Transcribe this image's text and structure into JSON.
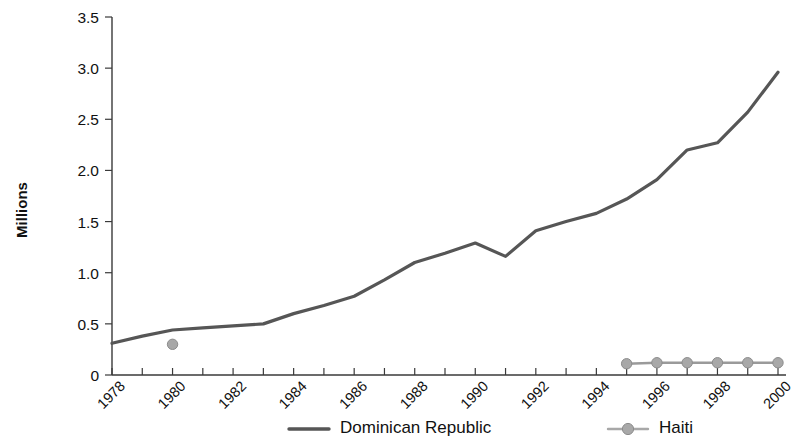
{
  "chart_data": {
    "type": "line",
    "title": "",
    "subtitle": "",
    "xlabel": "",
    "ylabel": "Millions",
    "xlim": [
      1978,
      2000
    ],
    "ylim": [
      0,
      3.5
    ],
    "grid": false,
    "legend_position": "bottom",
    "x": [
      1978,
      1979,
      1980,
      1981,
      1982,
      1983,
      1984,
      1985,
      1986,
      1987,
      1988,
      1989,
      1990,
      1991,
      1992,
      1993,
      1994,
      1995,
      1996,
      1997,
      1998,
      1999,
      2000
    ],
    "xtick_labels": [
      "1978",
      "1980",
      "1982",
      "1984",
      "1986",
      "1988",
      "1990",
      "1992",
      "1994",
      "1996",
      "1998",
      "2000"
    ],
    "xtick_values": [
      1978,
      1980,
      1982,
      1984,
      1986,
      1988,
      1990,
      1992,
      1994,
      1996,
      1998,
      2000
    ],
    "ytick_labels": [
      "0",
      "0.5",
      "1.0",
      "1.5",
      "2.0",
      "2.5",
      "3.0",
      "3.5"
    ],
    "ytick_values": [
      0,
      0.5,
      1.0,
      1.5,
      2.0,
      2.5,
      3.0,
      3.5
    ],
    "series": [
      {
        "name": "Dominican Republic",
        "color": "#565656",
        "marker": "none",
        "x": [
          1978,
          1979,
          1980,
          1981,
          1982,
          1983,
          1984,
          1985,
          1986,
          1987,
          1988,
          1989,
          1990,
          1991,
          1992,
          1993,
          1994,
          1995,
          1996,
          1997,
          1998,
          1999,
          2000
        ],
        "values": [
          0.31,
          0.38,
          0.44,
          0.46,
          0.48,
          0.5,
          0.6,
          0.68,
          0.77,
          0.93,
          1.1,
          1.19,
          1.29,
          1.16,
          1.41,
          1.5,
          1.58,
          1.72,
          1.91,
          2.2,
          2.27,
          2.57,
          2.96
        ]
      },
      {
        "name": "Haiti",
        "color": "#a8a8a8",
        "marker": "circle",
        "x": [
          1980,
          1995,
          1996,
          1997,
          1998,
          1999,
          2000
        ],
        "values": [
          0.3,
          0.11,
          0.12,
          0.12,
          0.12,
          0.12,
          0.12
        ]
      }
    ],
    "legend": [
      {
        "label": "Dominican Republic",
        "color": "#565656",
        "marker": "none"
      },
      {
        "label": "Haiti",
        "color": "#a8a8a8",
        "marker": "circle"
      }
    ]
  }
}
